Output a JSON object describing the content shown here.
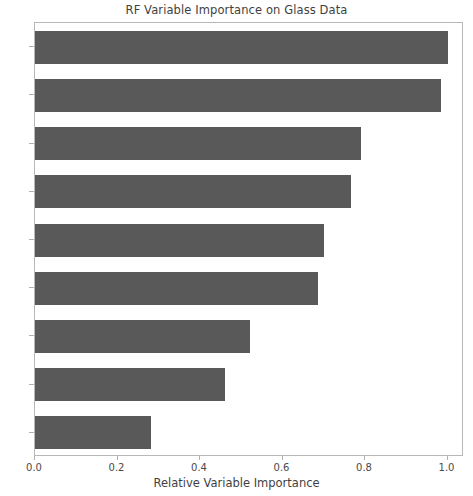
{
  "chart_data": {
    "type": "bar",
    "orientation": "horizontal",
    "title": "RF Variable Importance on Glass Data",
    "xlabel": "Relative Variable Importance",
    "ylabel": "",
    "categories": [
      "Mg",
      "Al",
      "Ca",
      "RI",
      "Na",
      "Ba",
      "Si",
      "K",
      "Fe"
    ],
    "values": [
      1.0,
      0.985,
      0.79,
      0.765,
      0.7,
      0.685,
      0.52,
      0.46,
      0.28
    ],
    "xlim": [
      0.0,
      1.04
    ],
    "xticks": [
      "0.0",
      "0.2",
      "0.4",
      "0.6",
      "0.8",
      "1.0"
    ],
    "xtick_values": [
      0.0,
      0.2,
      0.4,
      0.6,
      0.8,
      1.0
    ],
    "grid": false,
    "legend": false,
    "bar_color": "#595959",
    "axis_color": "#b8b8b8",
    "text_color": "#3f3f3f"
  }
}
